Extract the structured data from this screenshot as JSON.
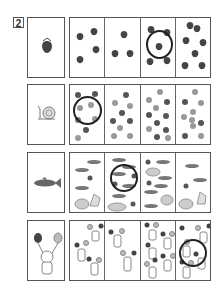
{
  "worksheet": {
    "problem_number": "2",
    "rows": [
      {
        "name": "strawberry",
        "reference_count": 1,
        "cell_counts": [
          4,
          3,
          5,
          7
        ],
        "circled_cell": 3
      },
      {
        "name": "snail",
        "reference_count": 1,
        "cell_counts": [
          8,
          9,
          11,
          10
        ],
        "circled_cell": 1
      },
      {
        "name": "fish",
        "reference_count": 1,
        "cell_counts": [
          6,
          7,
          8,
          5
        ],
        "circled_cell": 2
      },
      {
        "name": "cat-with-balloons",
        "reference_count": 1,
        "cell_counts": [
          3,
          2,
          5,
          4
        ],
        "circled_cell": 4
      }
    ]
  },
  "colors": {
    "border": "#555555",
    "item_dark": "#444444",
    "item_light": "#999999",
    "circle": "#222222"
  }
}
